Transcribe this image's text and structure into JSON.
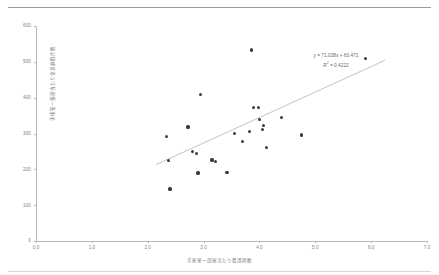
{
  "chart_data": {
    "type": "scatter",
    "title": "",
    "xlabel": "手術室一部屋当たり看護師数",
    "ylabel": "手術室一部屋当たり全身麻酔件数",
    "xlim": [
      0.0,
      7.0
    ],
    "ylim": [
      0,
      600
    ],
    "xticks": [
      "0.0",
      "1.0",
      "2.0",
      "3.0",
      "4.0",
      "5.0",
      "6.0",
      "7.0"
    ],
    "yticks": [
      "0",
      "100",
      "200",
      "300",
      "400",
      "500",
      "600"
    ],
    "grid": false,
    "legend": "none",
    "points": [
      {
        "x": 2.33,
        "y": 292
      },
      {
        "x": 2.37,
        "y": 224
      },
      {
        "x": 2.4,
        "y": 145
      },
      {
        "x": 2.72,
        "y": 318
      },
      {
        "x": 2.8,
        "y": 250
      },
      {
        "x": 2.87,
        "y": 244
      },
      {
        "x": 2.9,
        "y": 190
      },
      {
        "x": 2.95,
        "y": 408
      },
      {
        "x": 3.15,
        "y": 226
      },
      {
        "x": 3.22,
        "y": 222
      },
      {
        "x": 3.42,
        "y": 192
      },
      {
        "x": 3.55,
        "y": 300
      },
      {
        "x": 3.7,
        "y": 277
      },
      {
        "x": 3.82,
        "y": 305
      },
      {
        "x": 3.86,
        "y": 533
      },
      {
        "x": 3.9,
        "y": 372
      },
      {
        "x": 3.98,
        "y": 373
      },
      {
        "x": 4.0,
        "y": 340
      },
      {
        "x": 4.05,
        "y": 312
      },
      {
        "x": 4.07,
        "y": 322
      },
      {
        "x": 4.12,
        "y": 260
      },
      {
        "x": 4.4,
        "y": 344
      },
      {
        "x": 4.75,
        "y": 296
      },
      {
        "x": 5.9,
        "y": 510
      }
    ],
    "trendline": {
      "equation": "y = 71.038x + 60.471",
      "r_squared_label": "R",
      "r_squared_sup": "2",
      "r_squared_value": " = 0.4222",
      "slope": 71.038,
      "intercept": 60.471,
      "r2": 0.4222,
      "x_start": 2.15,
      "x_end": 6.25
    },
    "marker_color": "#3b3b46",
    "trendline_color": "#a8a8a8",
    "axis_color": "#b9b9b9",
    "text_color": "#808080"
  }
}
